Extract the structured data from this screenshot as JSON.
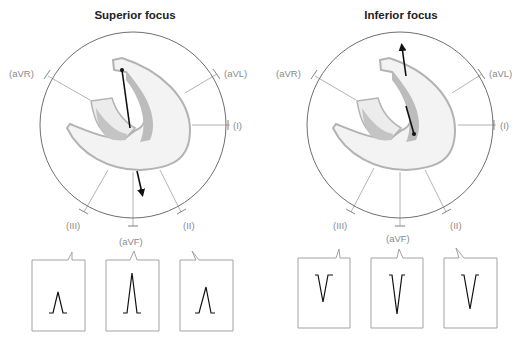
{
  "panels": [
    {
      "title": "Superior focus",
      "vector_direction": "downward",
      "leads": {
        "aVR": "(aVR)",
        "aVL": "(aVL)",
        "I": "(I)",
        "III": "(III)",
        "aVF": "(aVF)",
        "II": "(II)"
      },
      "ecg_boxes": [
        {
          "lead": "III",
          "deflection": "positive",
          "amplitude": "small"
        },
        {
          "lead": "aVF",
          "deflection": "positive",
          "amplitude": "large"
        },
        {
          "lead": "II",
          "deflection": "positive",
          "amplitude": "medium"
        }
      ]
    },
    {
      "title": "Inferior focus",
      "vector_direction": "upward",
      "leads": {
        "aVR": "(aVR)",
        "aVL": "(aVL)",
        "I": "(I)",
        "III": "(III)",
        "aVF": "(aVF)",
        "II": "(II)"
      },
      "ecg_boxes": [
        {
          "lead": "III",
          "deflection": "negative",
          "amplitude": "small"
        },
        {
          "lead": "aVF",
          "deflection": "negative",
          "amplitude": "large"
        },
        {
          "lead": "II",
          "deflection": "negative",
          "amplitude": "medium"
        }
      ]
    }
  ],
  "colors": {
    "circle": "#6f6f6f",
    "lead_line": "#a0a0a0",
    "heart_fill": "#f2f2f2",
    "heart_outline": "#b0b0b0",
    "chamber_dark": "#bdbdbd",
    "vector": "#111111",
    "label": "#8a8a8a"
  }
}
